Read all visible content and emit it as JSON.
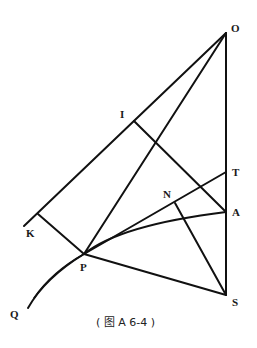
{
  "figure": {
    "caption": "( 图 A 6-4 )",
    "points": {
      "O": {
        "label": "O",
        "x": 226,
        "y": 33
      },
      "I": {
        "label": "I",
        "x": 134,
        "y": 121
      },
      "K": {
        "label": "K",
        "x": 38,
        "y": 241
      },
      "P": {
        "label": "P",
        "x": 84,
        "y": 254
      },
      "Q": {
        "label": "Q",
        "x": 28,
        "y": 308
      },
      "N": {
        "label": "N",
        "x": 175,
        "y": 203
      },
      "T": {
        "label": "T",
        "x": 226,
        "y": 172
      },
      "A": {
        "label": "A",
        "x": 226,
        "y": 212
      },
      "S": {
        "label": "S",
        "x": 226,
        "y": 295
      }
    },
    "stroke_color": "#111111"
  }
}
